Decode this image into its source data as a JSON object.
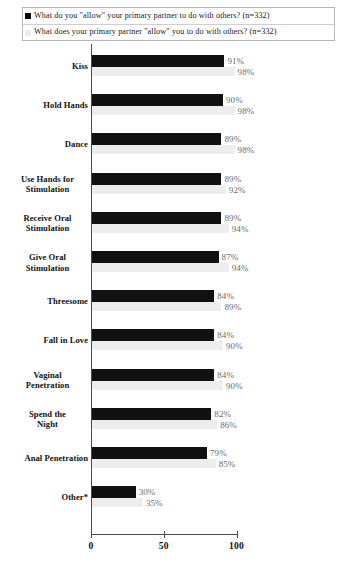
{
  "chart_data": {
    "type": "bar",
    "orientation": "horizontal",
    "title": "",
    "xlabel": "",
    "ylabel": "",
    "xlim": [
      0,
      100
    ],
    "xticks": [
      "0",
      "50",
      "100"
    ],
    "xtick_values": [
      0,
      50,
      100
    ],
    "grid": false,
    "legend_position": "top",
    "categories": [
      "Kiss",
      "Hold Hands",
      "Dance",
      "Use Hands for Stimulation",
      "Receive Oral Stimulation",
      "Give Oral Stimulation",
      "Threesome",
      "Fall in Love",
      "Vaginal Penetration",
      "Spend the Night",
      "Anal Penetration",
      "Other*"
    ],
    "series": [
      {
        "name": "What do you \"allow\" your primary partner to do with others? (n=332)",
        "color": "#111111",
        "values": [
          91,
          90,
          89,
          89,
          89,
          87,
          84,
          84,
          84,
          82,
          79,
          30
        ],
        "labels": [
          "91%",
          "90%",
          "89%",
          "89%",
          "89%",
          "87%",
          "84%",
          "84%",
          "84%",
          "82%",
          "79%",
          "30%"
        ]
      },
      {
        "name": "What does your primary partner \"allow\" you to do with others? (n=332)",
        "color": "#ededed",
        "values": [
          98,
          98,
          98,
          92,
          94,
          94,
          89,
          90,
          90,
          86,
          85,
          35
        ],
        "labels": [
          "98%",
          "98%",
          "98%",
          "92%",
          "94%",
          "94%",
          "89%",
          "90%",
          "90%",
          "86%",
          "85%",
          "35%"
        ]
      }
    ]
  },
  "legend": {
    "items": [
      {
        "marker": "filled-square-dark",
        "text": "What do you \"allow\" your primary partner to do with others? (n=332)"
      },
      {
        "marker": "filled-square-light",
        "text": "What does your primary partner \"allow\" you to do with others? (n=332)"
      }
    ]
  },
  "axis": {
    "x_ticks": [
      "0",
      "50",
      "100"
    ]
  }
}
